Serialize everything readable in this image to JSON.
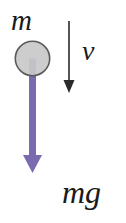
{
  "figure": {
    "background_color": "#ffffff"
  },
  "labels": {
    "mass": "m",
    "velocity": "v",
    "weight": "mg"
  },
  "body": {
    "name": "mass-circle",
    "shape": "circle",
    "center_x": 32.5,
    "center_y": 58.5,
    "radius": 17.5,
    "fill_color": "#c9c9c9",
    "stroke_color": "#5a5a5a",
    "stroke_width": 1.6
  },
  "vectors": [
    {
      "name": "velocity-vector",
      "label": "v",
      "direction": "down",
      "color": "#2a2a2a",
      "x": 69,
      "y_start": 21,
      "y_tip": 93,
      "stem_width": 1.6,
      "head_width": 11,
      "head_height": 13
    },
    {
      "name": "weight-vector",
      "label": "mg",
      "direction": "down",
      "color": "#7a6ab0",
      "x": 32.5,
      "y_start": 58.5,
      "y_tip": 173,
      "stem_width": 7,
      "head_width": 19,
      "head_height": 19
    }
  ]
}
